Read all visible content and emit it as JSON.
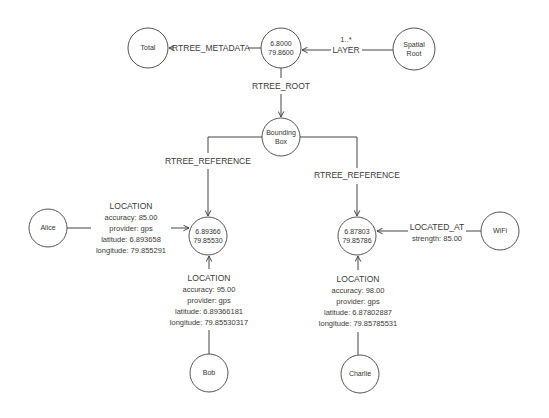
{
  "diagram": {
    "type": "graph",
    "nodes": {
      "total": {
        "lines": [
          "Total"
        ]
      },
      "root": {
        "lines": [
          "6.8000",
          "79.8600"
        ]
      },
      "spatial_root": {
        "lines": [
          "Spatial",
          "Root"
        ]
      },
      "bounding_box": {
        "lines": [
          "Bounding",
          "Box"
        ]
      },
      "leaf_left": {
        "lines": [
          "6.89366",
          "79.85530"
        ]
      },
      "leaf_right": {
        "lines": [
          "6.87803",
          "79.85786"
        ]
      },
      "alice": {
        "lines": [
          "Alice"
        ]
      },
      "wifi": {
        "lines": [
          "WiFi"
        ]
      },
      "bob": {
        "lines": [
          "Bob"
        ]
      },
      "charlie": {
        "lines": [
          "Charlie"
        ]
      }
    },
    "edges": {
      "rtree_metadata": {
        "label": "RTREE_METADATA",
        "from": "root",
        "to": "total"
      },
      "layer": {
        "cardinality": "1..*",
        "label": "LAYER",
        "from": "spatial_root",
        "to": "root"
      },
      "rtree_root": {
        "label": "RTREE_ROOT",
        "from": "root",
        "to": "bounding_box"
      },
      "rtree_reference_left": {
        "label": "RTREE_REFERENCE",
        "from": "bounding_box",
        "to": "leaf_left"
      },
      "rtree_reference_right": {
        "label": "RTREE_REFERENCE",
        "from": "bounding_box",
        "to": "leaf_right"
      },
      "alice_location": {
        "label": "LOCATION",
        "from": "alice",
        "to": "leaf_left",
        "props": [
          "accuracy: 85.00",
          "provider: gps",
          "latitude: 6.893658",
          "longitude: 79.855291"
        ]
      },
      "bob_location": {
        "label": "LOCATION",
        "from": "bob",
        "to": "leaf_left",
        "props": [
          "accuracy: 95.00",
          "provider: gps",
          "latitude: 6.89366181",
          "longitude: 79.85530317"
        ]
      },
      "charlie_location": {
        "label": "LOCATION",
        "from": "charlie",
        "to": "leaf_right",
        "props": [
          "accuracy: 98.00",
          "provider: gps",
          "latitude: 6.87802887",
          "longitude: 79.85785531"
        ]
      },
      "wifi_located_at": {
        "label": "LOCATED_AT",
        "from": "wifi",
        "to": "leaf_right",
        "props": [
          "strength: 85.00"
        ]
      }
    }
  }
}
